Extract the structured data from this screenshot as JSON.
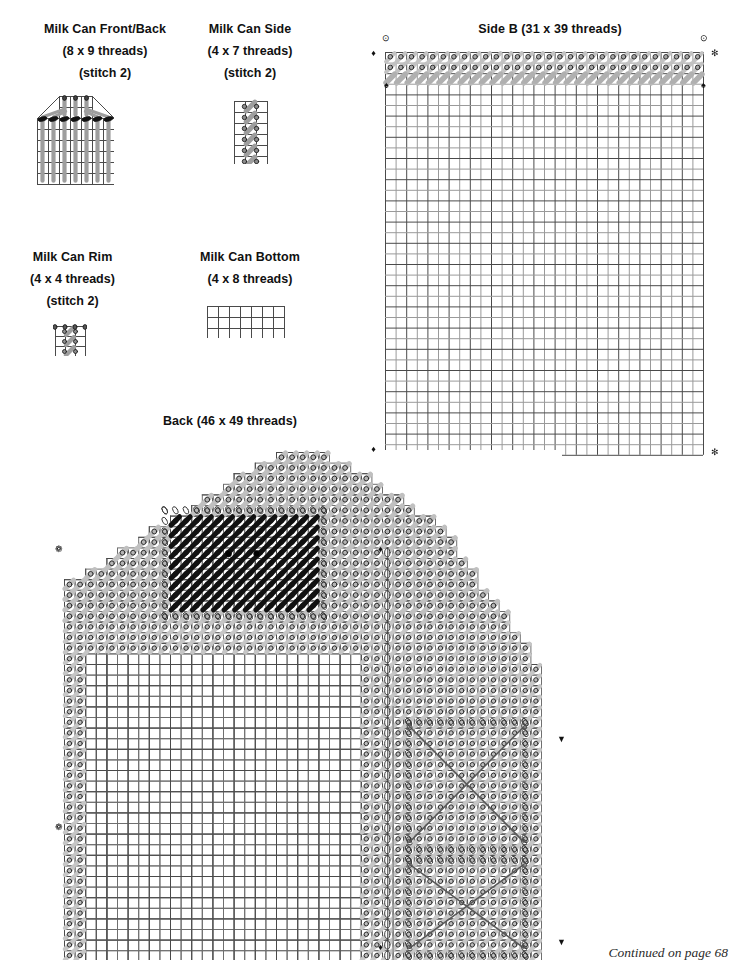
{
  "page": {
    "width": 736,
    "height": 969,
    "background": "#ffffff",
    "footer_note": "Continued on page 68"
  },
  "charts": [
    {
      "id": "milk-can-front-back",
      "title": "Milk Can Front/Back",
      "size_label": "(8 x 9 threads)",
      "stitch_label": "(stitch 2)",
      "cols": 8,
      "rows": 9,
      "grid_cols": 7,
      "grid_rows": 8,
      "type": "milk-can-body"
    },
    {
      "id": "milk-can-side",
      "title": "Milk Can Side",
      "size_label": "(4 x 7 threads)",
      "stitch_label": "(stitch 2)",
      "cols": 4,
      "rows": 7,
      "grid_cols": 3,
      "grid_rows": 6,
      "type": "milk-can-side"
    },
    {
      "id": "milk-can-rim",
      "title": "Milk Can Rim",
      "size_label": "(4 x 4 threads)",
      "stitch_label": "(stitch 2)",
      "cols": 4,
      "rows": 4,
      "grid_cols": 3,
      "grid_rows": 3,
      "type": "milk-can-rim"
    },
    {
      "id": "milk-can-bottom",
      "title": "Milk Can Bottom",
      "size_label": "(4 x 8 threads)",
      "stitch_label": "",
      "cols": 8,
      "rows": 4,
      "grid_cols": 7,
      "grid_rows": 3,
      "type": "plain"
    },
    {
      "id": "side-b",
      "title": "Side B (31 x 39 threads)",
      "size_label": "",
      "stitch_label": "",
      "cols": 31,
      "rows": 39,
      "grid_cols": 30,
      "grid_rows": 38,
      "type": "side-b"
    },
    {
      "id": "back",
      "title": "Back (46 x 49 threads)",
      "size_label": "",
      "stitch_label": "",
      "cols": 46,
      "rows": 49,
      "grid_cols": 45,
      "grid_rows": 48,
      "type": "barn-back"
    }
  ],
  "symbols": {
    "circle_dot": "⊙",
    "diamond": "♦",
    "spade": "♠",
    "asterisk": "✻",
    "club": "❁",
    "triangle_down": "▼",
    "bead": "oval-bead"
  },
  "colors": {
    "grid_line": "#4a4a4a",
    "grid_line_light": "#9a9a9a",
    "stitch_gray": "#9e9e9e",
    "stitch_dark": "#111111",
    "loop_outline": "#3a3a3a",
    "marker": "#111111",
    "marker_soft": "#8d8d8d",
    "text": "#111111"
  },
  "side_b_markers": [
    {
      "name": "circle-dot-marker-top-left",
      "symbol": "⊙",
      "x": 385,
      "y": 39
    },
    {
      "name": "circle-dot-marker-top-right",
      "symbol": "⊙",
      "x": 703,
      "y": 39
    },
    {
      "name": "diamond-marker-left-top",
      "symbol": "♦",
      "x": 373,
      "y": 54
    },
    {
      "name": "asterisk-marker-right-top",
      "symbol": "✻",
      "x": 714,
      "y": 54
    },
    {
      "name": "spade-marker-inner-left",
      "symbol": "♠",
      "x": 386,
      "y": 86
    },
    {
      "name": "spade-marker-inner-right",
      "symbol": "♠",
      "x": 703,
      "y": 86
    },
    {
      "name": "diamond-marker-left-bottom",
      "symbol": "♦",
      "x": 373,
      "y": 450
    },
    {
      "name": "asterisk-marker-right-bottom",
      "symbol": "✻",
      "x": 714,
      "y": 453
    }
  ],
  "back_markers": [
    {
      "name": "club-marker-left-upper",
      "symbol": "❁",
      "x": 58,
      "y": 550
    },
    {
      "name": "club-marker-left-lower",
      "symbol": "❁",
      "x": 58,
      "y": 828
    },
    {
      "name": "diamond-marker-right-upper",
      "symbol": "♦",
      "x": 380,
      "y": 550
    },
    {
      "name": "triangle-marker-right-upper",
      "symbol": "▼",
      "x": 561,
      "y": 740
    },
    {
      "name": "triangle-marker-right-lower",
      "symbol": "▼",
      "x": 561,
      "y": 943
    },
    {
      "name": "diamond-marker-bottom",
      "symbol": "♦",
      "x": 380,
      "y": 948
    }
  ]
}
